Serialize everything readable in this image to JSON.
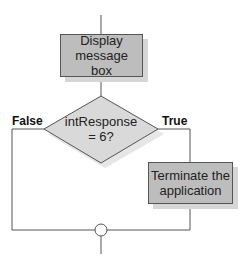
{
  "diagram": {
    "type": "flowchart",
    "process_display": {
      "label": "Display message box"
    },
    "decision": {
      "line1": "intResponse",
      "line2": "= 6?"
    },
    "branch_false": {
      "label": "False"
    },
    "branch_true": {
      "label": "True"
    },
    "process_terminate": {
      "line1": "Terminate the",
      "line2": "application"
    },
    "colors": {
      "box_fill": "#bdbdbd",
      "shadow": "#d6d6d6",
      "diamond_fill": "#d9d9d9",
      "line": "#555555"
    }
  }
}
